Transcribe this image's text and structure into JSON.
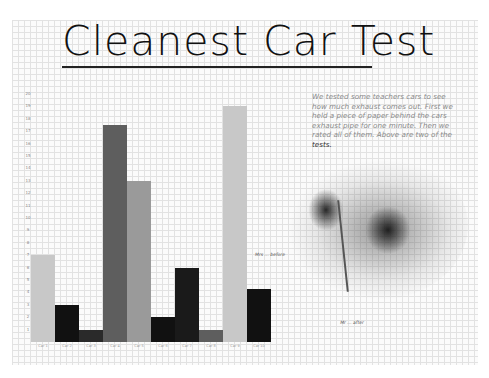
{
  "title": "Cleanest Car Test",
  "description": {
    "text": "We tested some teachers cars to see how much exhaust comes out. First we held a piece of paper behind the cars exhaust pipe for one minute. Then we rated all of them. Above are two of the ",
    "emphasis": "tests."
  },
  "annotations": {
    "before": "Mrs ... before",
    "after": "Mr ... after"
  },
  "y_axis": {
    "ticks": [
      "1",
      "2",
      "3",
      "4",
      "5",
      "6",
      "7",
      "8",
      "9",
      "10",
      "11",
      "12",
      "13",
      "14",
      "15",
      "16",
      "17",
      "18",
      "19",
      "20"
    ]
  },
  "colors": {
    "light_gray": "#c8c8c8",
    "medium_gray": "#9a9a9a",
    "dark_gray": "#5e5e5e",
    "black": "#111111",
    "stain_dark": "#1e1e1e"
  },
  "chart_data": {
    "type": "bar",
    "title": "Cleanest Car Test",
    "xlabel": "",
    "ylabel": "",
    "ylim": [
      0,
      20
    ],
    "grid": true,
    "legend": null,
    "categories": [
      "Car 1",
      "Car 2",
      "Car 3",
      "Car 4",
      "Car 5",
      "Car 6",
      "Car 7",
      "Car 8",
      "Car 9",
      "Car 10"
    ],
    "values": [
      7,
      3,
      1,
      17.5,
      13,
      2,
      6,
      1,
      19,
      4.3
    ],
    "bar_colors": [
      "#c8c8c8",
      "#111111",
      "#2a2a2a",
      "#5e5e5e",
      "#9a9a9a",
      "#111111",
      "#1a1a1a",
      "#5e5e5e",
      "#c8c8c8",
      "#111111"
    ],
    "note": "Hand-drawn bar chart on graph paper; x-axis labels are handwritten teacher names and are illegible at this resolution"
  }
}
